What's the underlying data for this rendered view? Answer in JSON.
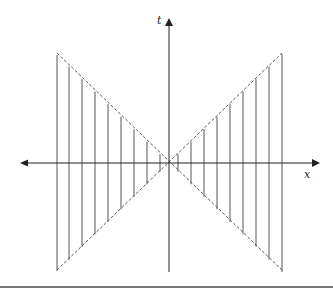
{
  "diagram": {
    "type": "spacetime-light-cone-diagram",
    "axes": {
      "horizontal": {
        "label": "x",
        "direction": "both"
      },
      "vertical": {
        "label": "t",
        "direction": "up"
      }
    },
    "origin": {
      "x": 169,
      "y": 163
    },
    "light_cone": {
      "style": "dashed",
      "lines": [
        {
          "from": [
            57,
            53
          ],
          "to": [
            282,
            270
          ]
        },
        {
          "from": [
            57,
            270
          ],
          "to": [
            282,
            53
          ]
        }
      ]
    },
    "vertical_segments_left_x": [
      57,
      69,
      82,
      95,
      108,
      121,
      134,
      147,
      160
    ],
    "vertical_segments_right_x": [
      178,
      191,
      204,
      217,
      230,
      243,
      256,
      269,
      282
    ],
    "colors": {
      "axis": "#222222",
      "segment": "#444444",
      "dashed": "#444444",
      "rule": "#777777"
    }
  }
}
